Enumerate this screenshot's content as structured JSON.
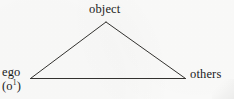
{
  "figure": {
    "kind": "triangle-relation-diagram",
    "background_color": "#fbfbfa",
    "stroke_color": "#33322f",
    "text_color": "#1b1b1b"
  },
  "nodes": {
    "apex": {
      "id": "object",
      "label": "object",
      "x": 106,
      "y": 22
    },
    "bottom_left": {
      "id": "ego",
      "label": "ego",
      "sublabel_open": "(o",
      "sublabel_superscript": "1",
      "sublabel_close": ")",
      "x": 30,
      "y": 78
    },
    "bottom_right": {
      "id": "others",
      "label": "others",
      "x": 185,
      "y": 78
    }
  },
  "edges": [
    {
      "name": "ego-to-object",
      "from": "ego",
      "to": "object"
    },
    {
      "name": "object-to-others",
      "from": "object",
      "to": "others"
    },
    {
      "name": "ego-to-others",
      "from": "ego",
      "to": "others"
    }
  ]
}
